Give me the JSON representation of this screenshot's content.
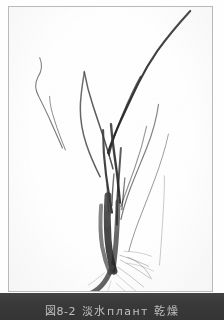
{
  "page": {
    "kind": "scanned-book-figure",
    "background_color": "#fdfdfd"
  },
  "plate": {
    "name": "plant-specimen-photograph",
    "frame_color": "#b9b9b9",
    "background_color": "#ffffff",
    "subject": "grass-like herbaceous plant specimen with long slender leaves, stems and fibrous root mass",
    "ink_color": "#2b2b2b"
  },
  "caption": {
    "bar_color": "#3b3b3b",
    "text_color": "#d2d2d2",
    "figure_number": "図8-2",
    "title": "淡水плант 乾燥",
    "full_text": "図8-2  淡水で乾燥す",
    "note": "caption partially cropped by page edge"
  },
  "specimen": {
    "leaves": [
      {
        "id": "leaf-main-upper-right",
        "path": "M 183 4 C 172 16 160 30 150 44 C 141 57 136 66 131 76 C 126 86 120 99 114 112 C 108 125 103 136 100 147",
        "width": 2.1,
        "opacity": 0.92
      },
      {
        "id": "leaf-long-center",
        "path": "M 101 149 C 104 136 109 122 115 108 C 121 94 127 81 133 70",
        "width": 1.7,
        "opacity": 0.8
      },
      {
        "id": "leaf-left-thin-upper",
        "path": "M 31 51 C 34 58 33 65 29 71 C 26 77 26 83 30 90 C 34 98 38 106 42 115 C 46 124 50 133 54 142",
        "width": 1.1,
        "opacity": 0.62
      },
      {
        "id": "leaf-left-mid",
        "path": "M 57 144 C 53 134 49 124 46 114 C 43 105 41 97 41 90",
        "width": 1.0,
        "opacity": 0.55
      },
      {
        "id": "leaf-fork-left",
        "path": "M 76 65 C 78 76 81 88 85 100 C 89 112 93 124 97 136 C 100 146 103 155 105 163",
        "width": 1.5,
        "opacity": 0.78
      },
      {
        "id": "leaf-fork-right",
        "path": "M 76 66 C 74 78 72 90 72 102 C 72 114 74 126 78 138 C 82 150 87 161 92 171",
        "width": 1.5,
        "opacity": 0.72
      },
      {
        "id": "leaf-right-arch-outer",
        "path": "M 151 98 C 149 112 145 127 139 142 C 133 157 127 171 122 184 C 118 195 115 205 113 214",
        "width": 1.2,
        "opacity": 0.6
      },
      {
        "id": "leaf-right-arch-inner",
        "path": "M 139 120 C 136 134 132 148 127 162 C 122 176 117 189 113 201",
        "width": 1.1,
        "opacity": 0.52
      },
      {
        "id": "leaf-far-right",
        "path": "M 161 128 C 158 142 153 158 147 174 C 141 190 135 205 130 218 C 126 229 123 238 121 246",
        "width": 1.0,
        "opacity": 0.48
      },
      {
        "id": "leaf-center-blade-1",
        "path": "M 103 118 C 104 132 106 146 108 160 C 110 174 111 186 112 197",
        "width": 2.4,
        "opacity": 0.9
      },
      {
        "id": "leaf-center-blade-2",
        "path": "M 95 124 C 95 139 96 154 98 169 C 100 183 102 196 104 207",
        "width": 2.2,
        "opacity": 0.88
      },
      {
        "id": "leaf-center-blade-3",
        "path": "M 113 142 C 112 156 111 170 110 184 C 109 197 109 209 109 219",
        "width": 2.0,
        "opacity": 0.82
      },
      {
        "id": "leaf-inner-short-a",
        "path": "M 106 168 C 105 179 104 190 104 200",
        "width": 1.4,
        "opacity": 0.7
      },
      {
        "id": "leaf-inner-short-b",
        "path": "M 117 172 C 116 183 115 194 114 204",
        "width": 1.3,
        "opacity": 0.65
      },
      {
        "id": "leaf-inner-short-c",
        "path": "M 99 178 C 99 188 100 198 101 208",
        "width": 1.2,
        "opacity": 0.6
      }
    ],
    "sheaths": [
      {
        "id": "sheath-main",
        "path": "M 100 190 C 99 205 99 220 100 234 C 101 246 103 257 106 266",
        "width": 7,
        "opacity": 0.85
      },
      {
        "id": "sheath-second",
        "path": "M 110 196 C 110 210 109 224 108 238 C 107 249 106 258 105 265",
        "width": 5,
        "opacity": 0.7
      },
      {
        "id": "sheath-third",
        "path": "M 93 200 C 92 214 92 228 94 241 C 96 252 99 261 102 268",
        "width": 4,
        "opacity": 0.6
      }
    ],
    "roots": [
      {
        "id": "root-main-stout",
        "path": "M 104 262 C 101 270 97 277 93 281 C 89 285 86 287 83 288",
        "width": 5,
        "opacity": 0.8
      },
      {
        "id": "root-fiber-1",
        "path": "M 112 250 C 122 253 132 257 141 261",
        "width": 0.7,
        "opacity": 0.45
      },
      {
        "id": "root-fiber-2",
        "path": "M 113 255 C 124 261 134 267 142 273",
        "width": 0.7,
        "opacity": 0.42
      },
      {
        "id": "root-fiber-3",
        "path": "M 110 262 C 120 269 129 276 136 282",
        "width": 0.7,
        "opacity": 0.4
      },
      {
        "id": "root-fiber-4",
        "path": "M 107 268 C 115 275 122 281 128 286",
        "width": 0.6,
        "opacity": 0.38
      },
      {
        "id": "root-fiber-5",
        "path": "M 116 246 C 126 246 136 248 144 251",
        "width": 0.6,
        "opacity": 0.38
      },
      {
        "id": "root-fiber-6",
        "path": "M 100 272 C 96 279 92 284 88 288",
        "width": 0.6,
        "opacity": 0.4
      },
      {
        "id": "root-fiber-7",
        "path": "M 96 268 C 90 273 85 277 80 280",
        "width": 0.6,
        "opacity": 0.38
      },
      {
        "id": "root-fiber-8",
        "path": "M 119 258 C 129 259 138 262 146 266",
        "width": 0.6,
        "opacity": 0.35
      },
      {
        "id": "root-fiber-9",
        "path": "M 108 278 C 113 283 118 287 123 290",
        "width": 0.55,
        "opacity": 0.34
      },
      {
        "id": "root-fiber-10",
        "path": "M 103 276 C 101 283 99 288 97 292",
        "width": 0.55,
        "opacity": 0.34
      },
      {
        "id": "root-tuft-right",
        "path": "M 120 252 C 131 256 139 264 144 274",
        "width": 0.8,
        "opacity": 0.4
      }
    ],
    "strand_right_hanging": {
      "id": "strand-right-hanging",
      "path": "M 157 170 C 157 186 156 202 155 218 C 154 234 153 248 152 260",
      "width": 0.8,
      "opacity": 0.4
    }
  }
}
